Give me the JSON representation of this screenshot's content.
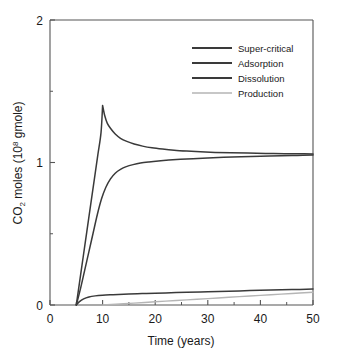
{
  "chart_data": {
    "type": "line",
    "title": "",
    "xlabel": "Time (years)",
    "ylabel_main": "CO",
    "ylabel_sub": "2",
    "ylabel_mid": " moles (10",
    "ylabel_sup": "8",
    "ylabel_end": " gmole)",
    "ylabel": "CO2 moles (10^8 gmole)",
    "xlim": [
      0,
      50
    ],
    "ylim": [
      0,
      2
    ],
    "xticks": [
      "0",
      "10",
      "20",
      "30",
      "40",
      "50"
    ],
    "xtick_values": [
      0,
      10,
      20,
      30,
      40,
      50
    ],
    "yticks": [
      "0",
      "1",
      "2"
    ],
    "ytick_values": [
      0,
      1,
      2
    ],
    "yminor_values": [
      0.5,
      1.5
    ],
    "grid": false,
    "legend_position": "upper right",
    "series": [
      {
        "name": "Super-critical",
        "color": "#3a3a3a",
        "x": [
          5,
          5.6,
          6.3,
          7.0,
          7.7,
          8.4,
          9.1,
          9.7,
          10.0,
          10.4,
          10.9,
          11.6,
          12.4,
          13.4,
          14.6,
          16.0,
          17.6,
          19.4,
          21.4,
          23.6,
          26.0,
          28.6,
          31.4,
          34.4,
          37.6,
          41.0,
          44.6,
          47.4,
          50.0
        ],
        "y": [
          0.0,
          0.155,
          0.335,
          0.515,
          0.695,
          0.875,
          1.055,
          1.21,
          1.4,
          1.33,
          1.275,
          1.235,
          1.2,
          1.17,
          1.148,
          1.13,
          1.115,
          1.103,
          1.094,
          1.086,
          1.08,
          1.075,
          1.071,
          1.068,
          1.066,
          1.064,
          1.062,
          1.061,
          1.06
        ]
      },
      {
        "name": "Adsorption",
        "color": "#3a3a3a",
        "x": [
          5,
          5.6,
          6.4,
          7.4,
          8.6,
          10.0,
          11.5,
          13.0,
          15.0,
          17.5,
          20.0,
          23.0,
          26.0,
          30.0,
          34.0,
          38.0,
          42.0,
          46.0,
          50.0
        ],
        "y": [
          0.0,
          0.024,
          0.043,
          0.056,
          0.064,
          0.069,
          0.072,
          0.074,
          0.077,
          0.08,
          0.083,
          0.086,
          0.089,
          0.093,
          0.097,
          0.101,
          0.105,
          0.108,
          0.112
        ]
      },
      {
        "name": "Dissolution",
        "color": "#3a3a3a",
        "x": [
          5,
          5.8,
          6.6,
          7.4,
          8.2,
          9.0,
          9.8,
          10.6,
          11.5,
          12.4,
          13.4,
          14.5,
          15.8,
          17.2,
          18.8,
          20.6,
          22.6,
          24.8,
          27.2,
          30.0,
          33.0,
          36.4,
          40.0,
          44.0,
          47.0,
          50.0
        ],
        "y": [
          0.0,
          0.115,
          0.245,
          0.375,
          0.505,
          0.635,
          0.745,
          0.825,
          0.885,
          0.925,
          0.952,
          0.971,
          0.985,
          0.996,
          1.004,
          1.011,
          1.017,
          1.022,
          1.027,
          1.032,
          1.036,
          1.04,
          1.044,
          1.048,
          1.05,
          1.052
        ]
      },
      {
        "name": "Production",
        "color": "#b5b5b5",
        "x": [
          10.0,
          14.0,
          18.0,
          22.0,
          26.0,
          30.0,
          34.0,
          38.0,
          42.0,
          46.0,
          50.0
        ],
        "y": [
          0.0,
          0.009,
          0.018,
          0.027,
          0.036,
          0.045,
          0.054,
          0.063,
          0.072,
          0.081,
          0.09
        ]
      }
    ],
    "legend": [
      {
        "label": "Super-critical",
        "color": "#3a3a3a"
      },
      {
        "label": "Adsorption",
        "color": "#3a3a3a"
      },
      {
        "label": "Dissolution",
        "color": "#3a3a3a"
      },
      {
        "label": "Production",
        "color": "#b5b5b5"
      }
    ]
  },
  "caption": ""
}
